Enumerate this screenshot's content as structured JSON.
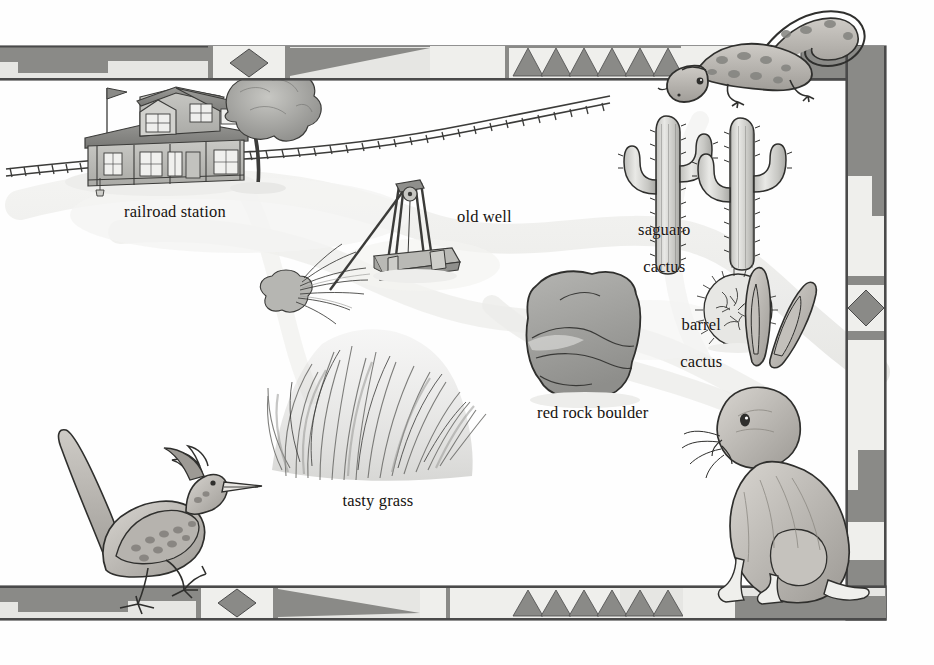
{
  "palette": {
    "paper": "#fefefe",
    "ink": "#16120f",
    "border_dark": "#7b7b7b",
    "border_mid": "#9d9d9d",
    "border_light": "#e3e3e0",
    "border_outline": "#4a4a4a",
    "wash_light": "#d9d9d6",
    "wash_mid": "#b0b0ad",
    "wash_dark": "#8a8a87",
    "path": "#ededea"
  },
  "labels": [
    {
      "name": "railroad-station",
      "text": "railroad station",
      "x": 124,
      "y": 211,
      "align": "left",
      "lines": [
        "railroad station"
      ]
    },
    {
      "name": "old-well",
      "text": "old well",
      "x": 457,
      "y": 216,
      "align": "left",
      "lines": [
        "old well"
      ]
    },
    {
      "name": "saguaro-cactus",
      "text": "saguaro cactus",
      "x": 660,
      "y": 211,
      "align": "center",
      "lines": [
        "saguaro",
        "cactus"
      ]
    },
    {
      "name": "barrel-cactus",
      "text": "barrel cactus",
      "x": 697,
      "y": 306,
      "align": "center",
      "lines": [
        "barrel",
        "cactus"
      ]
    },
    {
      "name": "red-rock-boulder",
      "text": "red rock boulder",
      "x": 537,
      "y": 412,
      "align": "left",
      "lines": [
        "red rock boulder"
      ]
    },
    {
      "name": "tasty-grass",
      "text": "tasty grass",
      "x": 378,
      "y": 500,
      "align": "center",
      "lines": [
        "tasty grass"
      ]
    }
  ],
  "features": [
    {
      "name": "railroad-station-building",
      "kind": "building",
      "label": "railroad station"
    },
    {
      "name": "railroad-track",
      "kind": "track",
      "label": "railroad track"
    },
    {
      "name": "shade-tree",
      "kind": "tree",
      "label": "tree"
    },
    {
      "name": "old-well-derrick",
      "kind": "well",
      "label": "old well"
    },
    {
      "name": "desert-shrub",
      "kind": "shrub",
      "label": "shrub"
    },
    {
      "name": "saguaro-cactus-left",
      "kind": "cactus",
      "label": "saguaro cactus"
    },
    {
      "name": "saguaro-cactus-right",
      "kind": "cactus",
      "label": "saguaro cactus"
    },
    {
      "name": "barrel-cactus-plant",
      "kind": "cactus",
      "label": "barrel cactus"
    },
    {
      "name": "red-rock-boulder-rock",
      "kind": "rock",
      "label": "red rock boulder"
    },
    {
      "name": "tasty-grass-clump",
      "kind": "grass",
      "label": "tasty grass"
    },
    {
      "name": "desert-path",
      "kind": "path",
      "label": "path"
    }
  ],
  "animals": [
    {
      "name": "lizard",
      "label": "lizard",
      "position": "top-right corner, perched on border"
    },
    {
      "name": "roadrunner",
      "label": "roadrunner",
      "position": "bottom-left, standing on border"
    },
    {
      "name": "jackrabbit",
      "label": "jackrabbit",
      "position": "bottom-right corner, sitting on border"
    }
  ],
  "border": {
    "name": "southwestern-border",
    "style": "geometric southwestern band",
    "motifs": [
      "stepped-block",
      "diamond",
      "triangle-row",
      "long-taper",
      "bar"
    ],
    "triangle_count_top": 6,
    "triangle_count_bottom": 6,
    "diamond_count_top": 1,
    "diamond_count_bottom": 1,
    "diamond_count_right": 2
  }
}
